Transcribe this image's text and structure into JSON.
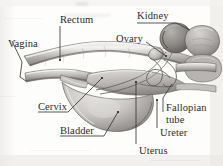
{
  "figure": {
    "kind": "anatomical-illustration",
    "rendering": "grayscale pencil / halftone scan on off-white paper",
    "width": 223,
    "height": 166,
    "colors": {
      "paper": "#fdfdfc",
      "ink": "#2b2b2b",
      "leader_line": "#3a3a3a",
      "organ_light": "#d8d5d2",
      "organ_mid": "#a9a5a2",
      "organ_dark": "#6f6b68",
      "kidney_dark": "#7a7672",
      "edge_shadow": "#c9c7c4"
    }
  },
  "labels": [
    {
      "id": "vagina",
      "text": "Vagina",
      "x": 8,
      "y": 38
    },
    {
      "id": "rectum",
      "text": "Rectum",
      "x": 60,
      "y": 22
    },
    {
      "id": "kidney",
      "text": "Kidney",
      "x": 137,
      "y": 10
    },
    {
      "id": "ovary",
      "text": "Ovary",
      "x": 116,
      "y": 38
    },
    {
      "id": "cervix",
      "text": "Cervix",
      "x": 38,
      "y": 103
    },
    {
      "id": "bladder",
      "text": "Bladder",
      "x": 60,
      "y": 127
    },
    {
      "id": "uterus",
      "text": "Uterus",
      "x": 133,
      "y": 146
    },
    {
      "id": "ureter",
      "text": "Ureter",
      "x": 158,
      "y": 129
    },
    {
      "id": "fallopian_tube",
      "text": "Fallopian tube",
      "x": 165,
      "y": 104
    }
  ],
  "parts": [
    {
      "name": "Vagina",
      "description": "tubular canal at lower left, drawn with bracket leader"
    },
    {
      "name": "Rectum",
      "description": "upper horizontal tube running left to right"
    },
    {
      "name": "Kidney",
      "description": "bean-shaped dark organ at upper right"
    },
    {
      "name": "Ovary",
      "description": "small oval body near the kidney, left of it"
    },
    {
      "name": "Cervix",
      "description": "narrow junction between vagina and uterus"
    },
    {
      "name": "Bladder",
      "description": "large rounded sac in lower middle"
    },
    {
      "name": "Uterus",
      "description": "body above and behind the bladder"
    },
    {
      "name": "Ureter",
      "description": "thin tube from kidney toward bladder"
    },
    {
      "name": "Fallopian tube",
      "description": "looping tube between ovary and uterus"
    }
  ]
}
